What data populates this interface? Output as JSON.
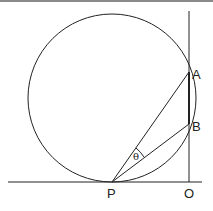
{
  "figure": {
    "labels": {
      "A": "A",
      "B": "B",
      "P": "P",
      "O": "O",
      "theta": "θ"
    },
    "colors": {
      "stroke": "#222222",
      "background": "#ffffff"
    },
    "geometry": {
      "circle": {
        "cx": 112,
        "cy": 98,
        "r": 84
      },
      "baseline": {
        "x1": 8,
        "y1": 182,
        "x2": 202,
        "y2": 182
      },
      "vertical": {
        "x1": 189,
        "y1": 11,
        "x2": 189,
        "y2": 182
      },
      "points": {
        "P": [
          112,
          182
        ],
        "O": [
          189,
          182
        ],
        "A": [
          189,
          72
        ],
        "B": [
          189,
          124
        ]
      }
    }
  }
}
